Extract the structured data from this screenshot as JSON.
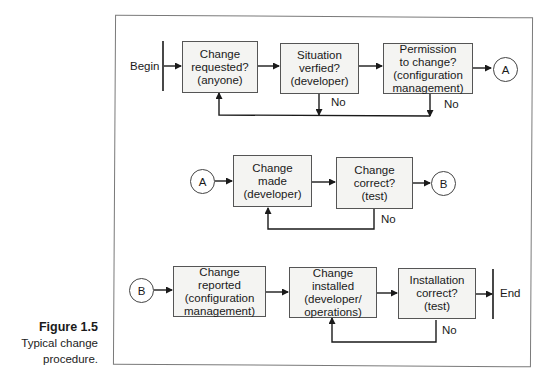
{
  "caption": {
    "figure": "Figure 1.5",
    "line1": "Typical change",
    "line2": "procedure."
  },
  "terminals": {
    "begin": "Begin",
    "end": "End"
  },
  "connectors": {
    "a": "A",
    "b": "B"
  },
  "rows": [
    {
      "steps": [
        {
          "label": "Change\nrequested?\n(anyone)"
        },
        {
          "label": "Situation\nverfied?\n(developer)"
        },
        {
          "label": "Permission\nto change?\n(configuration\nmanagement)"
        }
      ],
      "no_labels": [
        "No",
        "No"
      ]
    },
    {
      "steps": [
        {
          "label": "Change\nmade\n(developer)"
        },
        {
          "label": "Change\ncorrect?\n(test)"
        }
      ],
      "no_labels": [
        "No"
      ]
    },
    {
      "steps": [
        {
          "label": "Change\nreported\n(configuration\nmanagement)"
        },
        {
          "label": "Change\ninstalled\n(developer/\noperations)"
        },
        {
          "label": "Installation\ncorrect?\n(test)"
        }
      ],
      "no_labels": [
        "No"
      ]
    }
  ],
  "colors": {
    "line": "#1a1a1a",
    "box_fill": "#f4f4f2",
    "frame": "#7a7a7a"
  }
}
